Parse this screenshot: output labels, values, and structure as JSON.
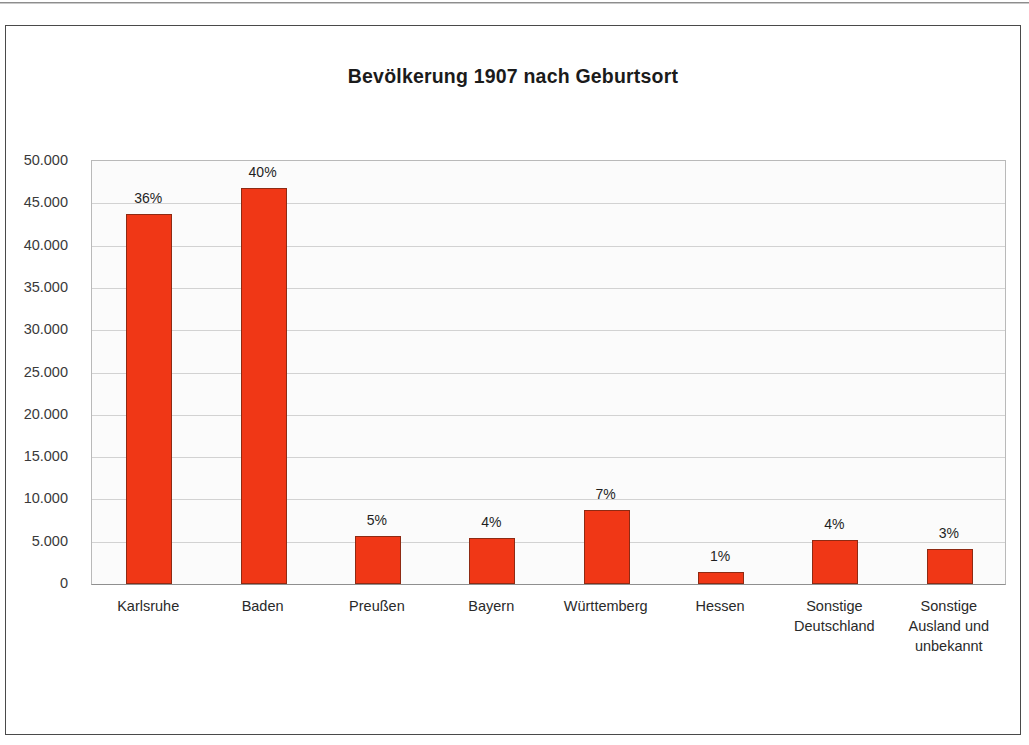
{
  "figure": {
    "title": "Bevölkerung 1907 nach Geburtsort",
    "bar_color": "#f03716",
    "bar_border_color": "#8e2a13",
    "plot_background": "#fbfbfb",
    "grid_color": "#d2d2d2",
    "frame_color": "#4a4a4a"
  },
  "chart_data": {
    "type": "bar",
    "title": "Bevölkerung 1907 nach Geburtsort",
    "xlabel": "",
    "ylabel": "",
    "grid": true,
    "legend": null,
    "ylim": [
      0,
      50000
    ],
    "ytick_step": 5000,
    "ytick_labels": [
      "50.000",
      "45.000",
      "40.000",
      "35.000",
      "30.000",
      "25.000",
      "20.000",
      "15.000",
      "10.000",
      "5.000",
      "0"
    ],
    "ytick_values": [
      50000,
      45000,
      40000,
      35000,
      30000,
      25000,
      20000,
      15000,
      10000,
      5000,
      0
    ],
    "categories": [
      "Karlsruhe",
      "Baden",
      "Preußen",
      "Bayern",
      "Württemberg",
      "Hessen",
      "Sonstige\nDeutschland",
      "Sonstige\nAusland und\nunbekannt"
    ],
    "category_lines": [
      [
        "Karlsruhe"
      ],
      [
        "Baden"
      ],
      [
        "Preußen"
      ],
      [
        "Bayern"
      ],
      [
        "Württemberg"
      ],
      [
        "Hessen"
      ],
      [
        "Sonstige",
        "Deutschland"
      ],
      [
        "Sonstige",
        "Ausland und",
        "unbekannt"
      ]
    ],
    "values": [
      43800,
      46850,
      5700,
      5450,
      8700,
      1450,
      5200,
      4100
    ],
    "data_labels": [
      "36%",
      "40%",
      "5%",
      "4%",
      "7%",
      "1%",
      "4%",
      "3%"
    ],
    "percentages": [
      36,
      40,
      5,
      4,
      7,
      1,
      4,
      3
    ]
  }
}
